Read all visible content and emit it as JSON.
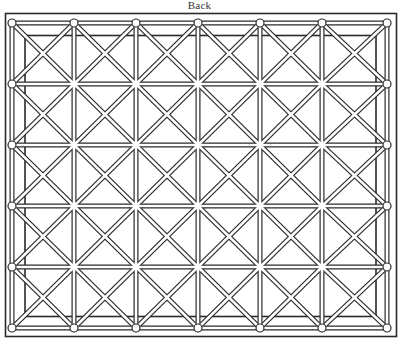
{
  "title": "Back",
  "colors": {
    "ink": "#2a2a2a",
    "paper": "#ffffff"
  },
  "outer_frame": {
    "x": 5.5,
    "y": 13.5,
    "width": 391,
    "height": 323
  },
  "inner_frame": {
    "x": 25,
    "y": 35.5,
    "width": 351,
    "height": 281
  },
  "grid": {
    "columns_x": [
      12,
      74,
      136,
      198,
      260,
      322,
      387
    ],
    "rows_y": [
      23,
      84,
      145,
      206,
      267,
      328
    ],
    "node_radius": 4,
    "rod_width": 5
  },
  "rods": {
    "horizontal": true,
    "vertical": true,
    "diagonal_down": true,
    "diagonal_up": true
  }
}
